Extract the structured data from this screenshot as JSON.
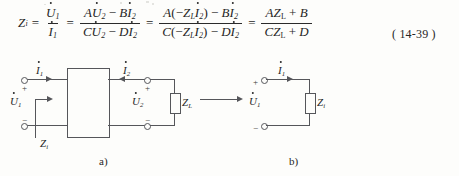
{
  "page": {
    "background": "#fdfdfb",
    "ink": "#262626",
    "line_color": "#55565a"
  },
  "equation": {
    "number": "( 14-39 )",
    "lhs": {
      "symbol": "Z",
      "subscript": "i"
    },
    "relations": [
      "=",
      "=",
      "=",
      "="
    ],
    "fraction_1": {
      "numerator": {
        "symbol": "U",
        "dot": true,
        "subscript": "1"
      },
      "denominator": {
        "symbol": "I",
        "dot": true,
        "subscript": "1"
      }
    },
    "fraction_2": {
      "numerator": "AU̇₂ − Bİ₂",
      "denominator": "CU̇₂ − Dİ₂",
      "num_terms": [
        {
          "coef": "A",
          "symbol": "U",
          "dot": true,
          "subscript": "2"
        },
        {
          "op": "−"
        },
        {
          "coef": "B",
          "symbol": "I",
          "dot": true,
          "subscript": "2"
        }
      ],
      "den_terms": [
        {
          "coef": "C",
          "symbol": "U",
          "dot": true,
          "subscript": "2"
        },
        {
          "op": "−"
        },
        {
          "coef": "D",
          "symbol": "I",
          "dot": true,
          "subscript": "2"
        }
      ]
    },
    "fraction_3": {
      "numerator": "A( − Zₗİ₂ ) − Bİ₂",
      "denominator": "C( − Zₗİ₂ ) − Dİ₂",
      "num_coef": "A",
      "den_coef": "C",
      "paren_open": "(",
      "paren_close": ")",
      "minus": "−",
      "load_symbol": "Z",
      "load_subscript": "L",
      "current_symbol": "I",
      "current_subscript": "2",
      "num_last_coef": "B",
      "den_last_coef": "D"
    },
    "fraction_4": {
      "numerator": "AZₗ + B",
      "denominator": "CZₗ + D",
      "num_coef": "A",
      "den_coef": "C",
      "load_symbol": "Z",
      "load_subscript": "L",
      "plus": "+",
      "num_const": "B",
      "den_const": "D"
    }
  },
  "figure_a": {
    "caption": "a)",
    "labels": {
      "current_1": {
        "symbol": "I",
        "subscript": "1"
      },
      "current_2": {
        "symbol": "I",
        "subscript": "2"
      },
      "voltage_1": {
        "symbol": "U",
        "subscript": "1"
      },
      "voltage_2": {
        "symbol": "U",
        "subscript": "2"
      },
      "load": {
        "symbol": "Z",
        "subscript": "L"
      },
      "input_impedance": {
        "symbol": "Z",
        "subscript": "i"
      }
    },
    "polarity": {
      "plus": "+",
      "minus": "−"
    },
    "two_port_box": "two-port network"
  },
  "figure_b": {
    "caption": "b)",
    "labels": {
      "current_1": {
        "symbol": "I",
        "subscript": "1"
      },
      "voltage_1": {
        "symbol": "U",
        "subscript": "1"
      },
      "impedance": {
        "symbol": "Z",
        "subscript": "i"
      }
    },
    "polarity": {
      "plus": "+",
      "minus": "−"
    }
  },
  "transition_arrow": "equivalent-to-arrow"
}
